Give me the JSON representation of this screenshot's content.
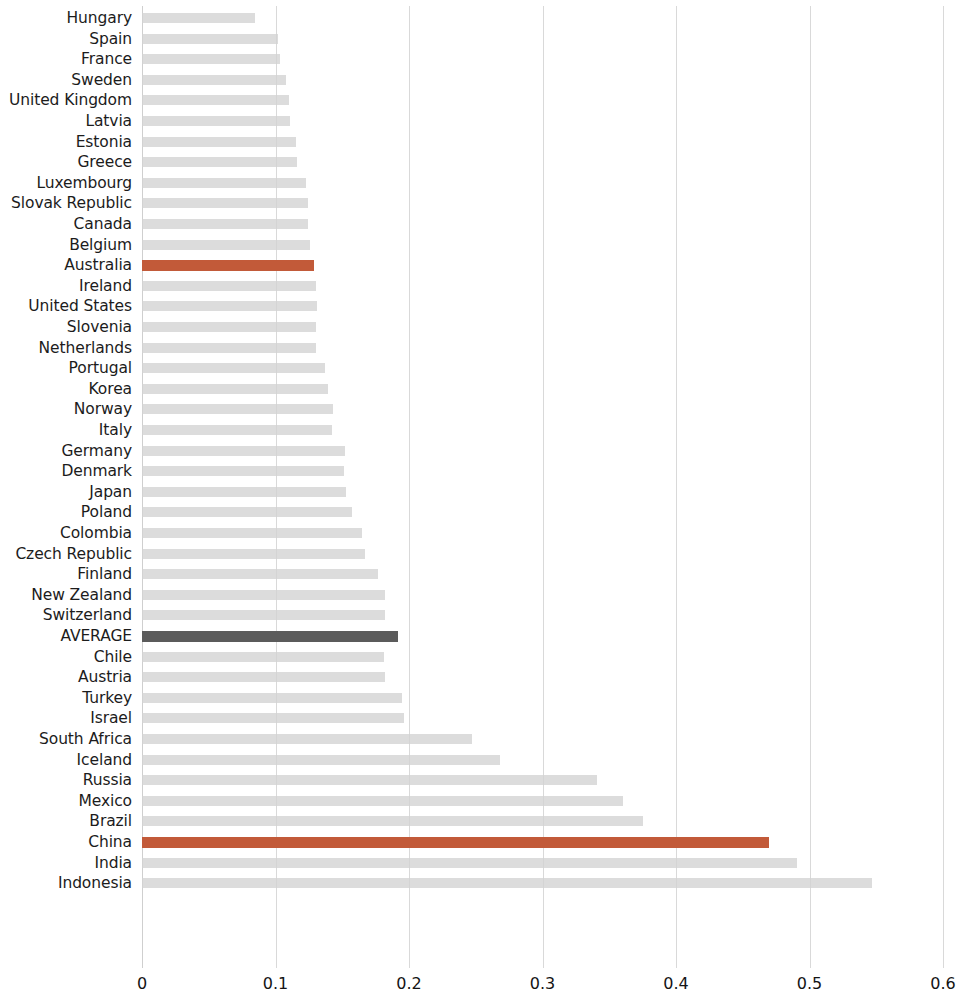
{
  "chart_data": {
    "type": "bar",
    "orientation": "horizontal",
    "title": "",
    "subtitle": "",
    "xlabel": "",
    "ylabel": "",
    "xlim": [
      0,
      0.6
    ],
    "xticks": [
      0,
      0.1,
      0.2,
      0.3,
      0.4,
      0.5,
      0.6
    ],
    "xtick_labels": [
      "0",
      "0.1",
      "0.2",
      "0.3",
      "0.4",
      "0.5",
      "0.6"
    ],
    "grid": "vertical",
    "legend": "none",
    "colors": {
      "default_bar": "#d2d2d2",
      "highlight_bar": "#c25a39",
      "average_bar": "#5b5b5b",
      "gridline": "#d9d9d9",
      "label_text": "#1c1c1c"
    },
    "highlight_categories": [
      "Australia",
      "China"
    ],
    "average_category": "AVERAGE",
    "categories": [
      "Hungary",
      "Spain",
      "France",
      "Sweden",
      "United Kingdom",
      "Latvia",
      "Estonia",
      "Greece",
      "Luxembourg",
      "Slovak Republic",
      "Canada",
      "Belgium",
      "Australia",
      "Ireland",
      "United States",
      "Slovenia",
      "Netherlands",
      "Portugal",
      "Korea",
      "Norway",
      "Italy",
      "Germany",
      "Denmark",
      "Japan",
      "Poland",
      "Colombia",
      "Czech Republic",
      "Finland",
      "New Zealand",
      "Switzerland",
      "AVERAGE",
      "Chile",
      "Austria",
      "Turkey",
      "Israel",
      "South Africa",
      "Iceland",
      "Russia",
      "Mexico",
      "Brazil",
      "China",
      "India",
      "Indonesia"
    ],
    "values": [
      0.085,
      0.102,
      0.103,
      0.108,
      0.11,
      0.111,
      0.115,
      0.116,
      0.123,
      0.124,
      0.124,
      0.126,
      0.129,
      0.13,
      0.131,
      0.13,
      0.13,
      0.137,
      0.139,
      0.143,
      0.142,
      0.152,
      0.151,
      0.153,
      0.157,
      0.165,
      0.167,
      0.177,
      0.182,
      0.182,
      0.192,
      0.181,
      0.182,
      0.195,
      0.196,
      0.247,
      0.268,
      0.341,
      0.36,
      0.375,
      0.47,
      0.491,
      0.547
    ]
  }
}
